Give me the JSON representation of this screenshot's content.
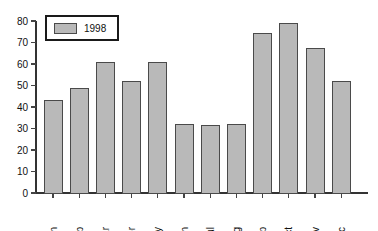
{
  "chart_data": {
    "type": "bar",
    "title": "",
    "xlabel": "",
    "ylabel": "",
    "ylim": [
      0,
      80
    ],
    "ytick_step": 10,
    "grid": false,
    "legend_position": "top-left",
    "categories": [
      "Jan",
      "Feb",
      "Mar",
      "Apr",
      "May",
      "Jun",
      "Jul",
      "Aug",
      "Sep",
      "Oct",
      "Nov",
      "Dec"
    ],
    "series": [
      {
        "name": "1998",
        "values": [
          43,
          48.5,
          60.5,
          52,
          60.5,
          32,
          31.5,
          32,
          74,
          79,
          67,
          52
        ]
      }
    ],
    "ytick_labels": [
      "0",
      "10",
      "20",
      "30",
      "40",
      "50",
      "60",
      "70",
      "80"
    ],
    "colors": {
      "bar_fill": "#b9b9b9",
      "bar_stroke": "#4a4a4a",
      "axis": "#333333",
      "text": "#111111",
      "background": "#ffffff"
    }
  },
  "legend": {
    "entries": [
      {
        "label": "1998",
        "swatch_color": "#b9b9b9"
      }
    ]
  }
}
